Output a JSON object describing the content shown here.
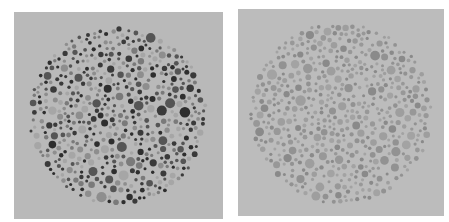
{
  "figure": {
    "panels": [
      {
        "id": "left",
        "label": "",
        "background": "#b9b9b9",
        "circle_center": [
          104,
          104
        ],
        "circle_radius": 90,
        "dot_colors": [
          "#2e2e2e",
          "#3a3a3a",
          "#555555",
          "#7a7a7a",
          "#8e8e8e",
          "#a6a6a6"
        ],
        "dot_count": 520,
        "seed": 7
      },
      {
        "id": "right",
        "label": "",
        "background": "#bcbcbc",
        "circle_center": [
          103,
          104
        ],
        "circle_radius": 92,
        "dot_colors": [
          "#8a8a8a",
          "#929292",
          "#989898",
          "#9e9e9e",
          "#a3a3a3"
        ],
        "dot_count": 520,
        "seed": 13
      }
    ]
  }
}
